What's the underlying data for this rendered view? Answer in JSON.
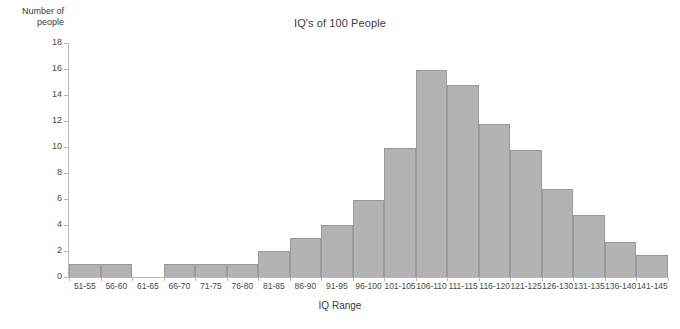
{
  "chart_data": {
    "type": "bar",
    "title": "IQ's of 100 People",
    "xlabel": "IQ Range",
    "ylabel": "Number of people",
    "ylim": [
      0,
      18
    ],
    "ytick_step": 2,
    "yticks": [
      0,
      2,
      4,
      6,
      8,
      10,
      12,
      14,
      16,
      18
    ],
    "grid": false,
    "legend": null,
    "bar_color": "#b3b3b3",
    "bar_edge_color": "#9a9a9a",
    "axis_color": "#b9b9b9",
    "categories": [
      "51-55",
      "56-60",
      "61-65",
      "66-70",
      "71-75",
      "76-80",
      "81-85",
      "86-90",
      "91-95",
      "96-100",
      "101-105",
      "106-110",
      "111-115",
      "116-120",
      "121-125",
      "126-130",
      "131-135",
      "136-140",
      "141-145"
    ],
    "values": [
      1,
      1,
      0,
      1,
      1,
      1,
      2,
      3,
      4,
      5.9,
      9.9,
      15.9,
      14.8,
      11.8,
      9.8,
      6.8,
      4.8,
      2.7,
      1.7
    ]
  },
  "axis": {
    "y_title_line1": "Number of",
    "y_title_line2": "people"
  }
}
